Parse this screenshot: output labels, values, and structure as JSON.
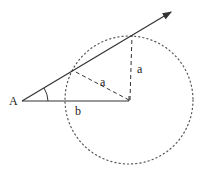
{
  "diagram": {
    "labels": {
      "point_A": "A",
      "hyp_a": "a",
      "vert_a": "a",
      "base_b": "b"
    },
    "colors": {
      "stroke": "#333333",
      "dotted": "#555555",
      "background": "#ffffff"
    },
    "elements": {
      "circle": {
        "cx": 129,
        "cy": 100,
        "r": 64,
        "style": "dotted"
      },
      "ray": {
        "from": [
          22,
          101
        ],
        "to": [
          171,
          12
        ],
        "arrow": true
      },
      "base_segment": {
        "from": [
          22,
          101
        ],
        "to": [
          129,
          101
        ]
      },
      "radius_to_near_point": {
        "from": [
          129,
          100
        ],
        "to": [
          72,
          70
        ],
        "style": "dashed"
      },
      "radius_to_far_point": {
        "from": [
          129,
          100
        ],
        "to": [
          132,
          34
        ],
        "style": "dashed"
      },
      "angle_arc_at_A": true
    }
  }
}
